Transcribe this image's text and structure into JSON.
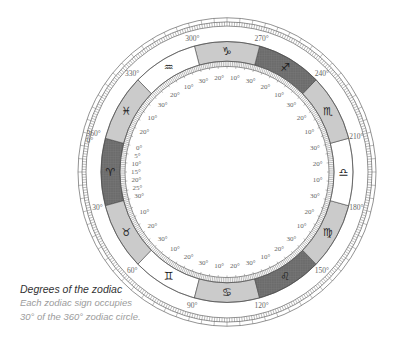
{
  "figure": {
    "title": "Degrees of the zodiac",
    "caption_lines": [
      "Each zodiac sign occupies",
      "30° of the 360° zodiac circle."
    ]
  },
  "diagram": {
    "type": "zodiac-wheel",
    "orientation": "0° Aries at left, degrees increase counter-clockwise",
    "colors": {
      "dark": "#6b6b6b",
      "dark_grid": "#7c7c7c",
      "light": "#cbcbcb",
      "white": "#ffffff",
      "line": "#4a4a4a",
      "tick": "#6a6a6a"
    },
    "signs": [
      {
        "name": "Aries",
        "glyph": "♈",
        "start": 0,
        "fill": "dark",
        "inner_labels": [
          "0°",
          "5°",
          "10°",
          "15°",
          "20°",
          "25°",
          "30°"
        ]
      },
      {
        "name": "Taurus",
        "glyph": "♉",
        "start": 30,
        "fill": "light",
        "inner_labels": [
          "10°",
          "20°",
          "30°"
        ]
      },
      {
        "name": "Gemini",
        "glyph": "♊",
        "start": 60,
        "fill": "white",
        "inner_labels": [
          "10°",
          "20°",
          "30°"
        ]
      },
      {
        "name": "Cancer",
        "glyph": "♋",
        "start": 90,
        "fill": "light",
        "inner_labels": [
          "10°",
          "20°",
          "30°"
        ]
      },
      {
        "name": "Leo",
        "glyph": "♌",
        "start": 120,
        "fill": "dark",
        "inner_labels": [
          "10°",
          "20°",
          "30°"
        ]
      },
      {
        "name": "Virgo",
        "glyph": "♍",
        "start": 150,
        "fill": "light",
        "inner_labels": [
          "10°",
          "20°",
          "30°"
        ]
      },
      {
        "name": "Libra",
        "glyph": "♎",
        "start": 180,
        "fill": "white",
        "inner_labels": [
          "10°",
          "20°",
          "30°"
        ]
      },
      {
        "name": "Scorpio",
        "glyph": "♏",
        "start": 210,
        "fill": "light",
        "inner_labels": [
          "10°",
          "20°",
          "30°"
        ]
      },
      {
        "name": "Sagittarius",
        "glyph": "♐",
        "start": 240,
        "fill": "dark",
        "inner_labels": [
          "10°",
          "20°",
          "30°"
        ]
      },
      {
        "name": "Capricorn",
        "glyph": "♑",
        "start": 270,
        "fill": "light",
        "inner_labels": [
          "10°",
          "20°",
          "30°"
        ]
      },
      {
        "name": "Aquarius",
        "glyph": "♒",
        "start": 300,
        "fill": "white",
        "inner_labels": [
          "10°",
          "20°",
          "30°"
        ]
      },
      {
        "name": "Pisces",
        "glyph": "♓",
        "start": 330,
        "fill": "light",
        "inner_labels": [
          "10°",
          "20°"
        ]
      }
    ],
    "outer_labels": [
      {
        "deg": 0,
        "lines": [
          "360°",
          "0°"
        ]
      },
      {
        "deg": 30,
        "lines": [
          "30°"
        ]
      },
      {
        "deg": 60,
        "lines": [
          "60°"
        ]
      },
      {
        "deg": 90,
        "lines": [
          "90°"
        ]
      },
      {
        "deg": 120,
        "lines": [
          "120°"
        ]
      },
      {
        "deg": 150,
        "lines": [
          "150°"
        ]
      },
      {
        "deg": 180,
        "lines": [
          "180°"
        ]
      },
      {
        "deg": 210,
        "lines": [
          "210°"
        ]
      },
      {
        "deg": 240,
        "lines": [
          "240°"
        ]
      },
      {
        "deg": 270,
        "lines": [
          "270°"
        ]
      },
      {
        "deg": 300,
        "lines": [
          "300°"
        ]
      },
      {
        "deg": 330,
        "lines": [
          "330°"
        ]
      }
    ]
  }
}
